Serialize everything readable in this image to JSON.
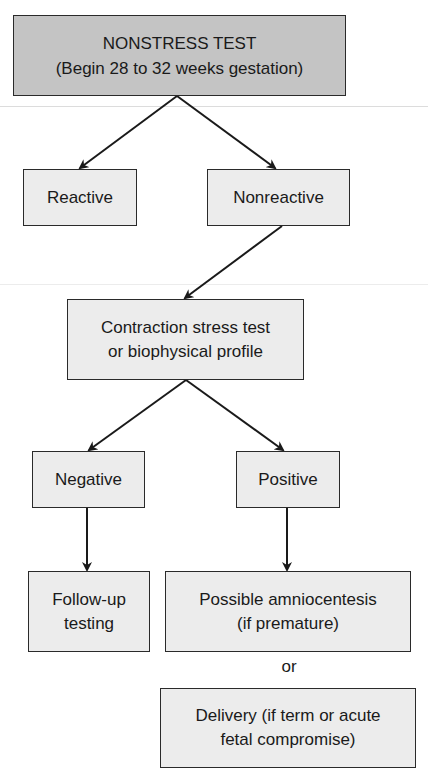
{
  "diagram": {
    "type": "flowchart",
    "nodes": {
      "nonstress_test": {
        "line1": "NONSTRESS TEST",
        "line2": "(Begin 28 to 32 weeks gestation)"
      },
      "reactive": {
        "label": "Reactive"
      },
      "nonreactive": {
        "label": "Nonreactive"
      },
      "contraction_test": {
        "line1": "Contraction stress test",
        "line2": "or biophysical profile"
      },
      "negative": {
        "label": "Negative"
      },
      "positive": {
        "label": "Positive"
      },
      "follow_up": {
        "line1": "Follow-up",
        "line2": "testing"
      },
      "amniocentesis": {
        "line1": "Possible amniocentesis",
        "line2": "(if premature)"
      },
      "delivery": {
        "line1": "Delivery (if term or acute",
        "line2": "fetal compromise)"
      }
    },
    "or_label": "or",
    "edges": [
      [
        "nonstress_test",
        "reactive"
      ],
      [
        "nonstress_test",
        "nonreactive"
      ],
      [
        "nonreactive",
        "contraction_test"
      ],
      [
        "contraction_test",
        "negative"
      ],
      [
        "contraction_test",
        "positive"
      ],
      [
        "negative",
        "follow_up"
      ],
      [
        "positive",
        "amniocentesis"
      ]
    ],
    "colors": {
      "root_fill": "#c4c4c4",
      "node_fill": "#ececec",
      "stroke": "#2a2a2a"
    }
  }
}
